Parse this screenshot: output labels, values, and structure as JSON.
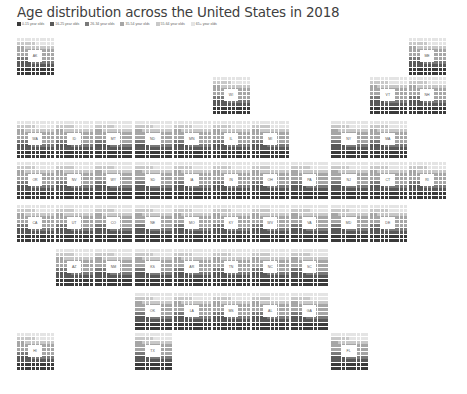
{
  "chart_data": {
    "type": "waffle-tile-map",
    "title": "Age distribution across the United States in 2018",
    "legend": [
      {
        "label": "0-15 year olds",
        "color": "#3a3a3a"
      },
      {
        "label": "16-25 year olds",
        "color": "#595959"
      },
      {
        "label": "26-34 year olds",
        "color": "#7a7a7a"
      },
      {
        "label": "35-54 year olds",
        "color": "#a6a6a6"
      },
      {
        "label": "55-64 year olds",
        "color": "#c8c8c8"
      },
      {
        "label": "65+ year olds",
        "color": "#e4e4e4"
      }
    ],
    "states": [
      {
        "abbr": "AK",
        "col": 0,
        "row": 0
      },
      {
        "abbr": "ME",
        "col": 10,
        "row": 0
      },
      {
        "abbr": "WI",
        "col": 5,
        "row": 1
      },
      {
        "abbr": "VT",
        "col": 9,
        "row": 1
      },
      {
        "abbr": "NH",
        "col": 10,
        "row": 1
      },
      {
        "abbr": "WA",
        "col": 0,
        "row": 2
      },
      {
        "abbr": "ID",
        "col": 1,
        "row": 2
      },
      {
        "abbr": "MT",
        "col": 2,
        "row": 2
      },
      {
        "abbr": "ND",
        "col": 3,
        "row": 2
      },
      {
        "abbr": "MN",
        "col": 4,
        "row": 2
      },
      {
        "abbr": "IL",
        "col": 5,
        "row": 2
      },
      {
        "abbr": "MI",
        "col": 6,
        "row": 2
      },
      {
        "abbr": "NY",
        "col": 8,
        "row": 2
      },
      {
        "abbr": "MA",
        "col": 9,
        "row": 2
      },
      {
        "abbr": "OR",
        "col": 0,
        "row": 3
      },
      {
        "abbr": "NV",
        "col": 1,
        "row": 3
      },
      {
        "abbr": "WY",
        "col": 2,
        "row": 3
      },
      {
        "abbr": "SD",
        "col": 3,
        "row": 3
      },
      {
        "abbr": "IA",
        "col": 4,
        "row": 3
      },
      {
        "abbr": "IN",
        "col": 5,
        "row": 3
      },
      {
        "abbr": "OH",
        "col": 6,
        "row": 3
      },
      {
        "abbr": "PA",
        "col": 7,
        "row": 3
      },
      {
        "abbr": "NJ",
        "col": 8,
        "row": 3
      },
      {
        "abbr": "CT",
        "col": 9,
        "row": 3
      },
      {
        "abbr": "RI",
        "col": 10,
        "row": 3
      },
      {
        "abbr": "CA",
        "col": 0,
        "row": 4
      },
      {
        "abbr": "UT",
        "col": 1,
        "row": 4
      },
      {
        "abbr": "CO",
        "col": 2,
        "row": 4
      },
      {
        "abbr": "NE",
        "col": 3,
        "row": 4
      },
      {
        "abbr": "MO",
        "col": 4,
        "row": 4
      },
      {
        "abbr": "KY",
        "col": 5,
        "row": 4
      },
      {
        "abbr": "WV",
        "col": 6,
        "row": 4
      },
      {
        "abbr": "VA",
        "col": 7,
        "row": 4
      },
      {
        "abbr": "MD",
        "col": 8,
        "row": 4
      },
      {
        "abbr": "DE",
        "col": 9,
        "row": 4
      },
      {
        "abbr": "AZ",
        "col": 1,
        "row": 5
      },
      {
        "abbr": "NM",
        "col": 2,
        "row": 5
      },
      {
        "abbr": "KS",
        "col": 3,
        "row": 5
      },
      {
        "abbr": "AR",
        "col": 4,
        "row": 5
      },
      {
        "abbr": "TN",
        "col": 5,
        "row": 5
      },
      {
        "abbr": "NC",
        "col": 6,
        "row": 5
      },
      {
        "abbr": "SC",
        "col": 7,
        "row": 5
      },
      {
        "abbr": "OK",
        "col": 3,
        "row": 6
      },
      {
        "abbr": "LA",
        "col": 4,
        "row": 6
      },
      {
        "abbr": "MS",
        "col": 5,
        "row": 6
      },
      {
        "abbr": "AL",
        "col": 6,
        "row": 6
      },
      {
        "abbr": "GA",
        "col": 7,
        "row": 6
      },
      {
        "abbr": "HI",
        "col": 0,
        "row": 7
      },
      {
        "abbr": "TX",
        "col": 3,
        "row": 7
      },
      {
        "abbr": "FL",
        "col": 8,
        "row": 7
      }
    ],
    "approx_distribution_pct": {
      "0-15": 20,
      "16-25": 14,
      "26-34": 12,
      "35-54": 26,
      "55-64": 13,
      "65+": 15
    }
  }
}
